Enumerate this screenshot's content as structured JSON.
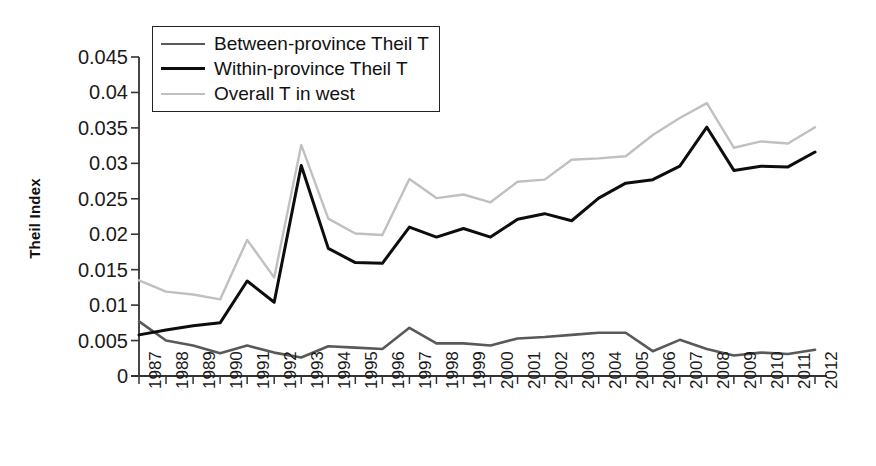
{
  "chart_data": {
    "type": "line",
    "title": "",
    "xlabel": "",
    "ylabel": "Theil Index",
    "ylim": [
      0,
      0.045
    ],
    "ytick_values": [
      0,
      0.005,
      0.01,
      0.015,
      0.02,
      0.025,
      0.03,
      0.035,
      0.04,
      0.045
    ],
    "ytick_labels": [
      "0",
      "0.005",
      "0.01",
      "0.015",
      "0.02",
      "0.025",
      "0.03",
      "0.035",
      "0.04",
      "0.045"
    ],
    "grid": false,
    "legend_position": "top-left-inside",
    "categories": [
      1987,
      1988,
      1989,
      1990,
      1991,
      1992,
      1993,
      1994,
      1995,
      1996,
      1997,
      1998,
      1999,
      2000,
      2001,
      2002,
      2003,
      2004,
      2005,
      2006,
      2007,
      2008,
      2009,
      2010,
      2011,
      2012
    ],
    "xtick_labels": [
      "1987",
      "1988",
      "1989",
      "1990",
      "1991",
      "1992",
      "1993",
      "1994",
      "1995",
      "1996",
      "1997",
      "1998",
      "1999",
      "2000",
      "2001",
      "2002",
      "2003",
      "2004",
      "2005",
      "2006",
      "2007",
      "2008",
      "2009",
      "2010",
      "2011",
      "2012"
    ],
    "series": [
      {
        "name": "Between-province Theil T",
        "color": "#595959",
        "width": 2.6,
        "values": [
          0.0077,
          0.005,
          0.0043,
          0.0032,
          0.0043,
          0.0033,
          0.0026,
          0.0042,
          0.004,
          0.0038,
          0.0068,
          0.0046,
          0.0046,
          0.0043,
          0.0053,
          0.0055,
          0.0058,
          0.0061,
          0.0061,
          0.0035,
          0.0051,
          0.0038,
          0.0029,
          0.0033,
          0.0031,
          0.0037
        ]
      },
      {
        "name": "Within-province Theil T",
        "color": "#0d0d0d",
        "width": 3.0,
        "values": [
          0.0058,
          0.0065,
          0.0071,
          0.0075,
          0.0134,
          0.0104,
          0.0297,
          0.018,
          0.016,
          0.0159,
          0.021,
          0.0196,
          0.0208,
          0.0196,
          0.0221,
          0.0229,
          0.0219,
          0.0251,
          0.0272,
          0.0277,
          0.0296,
          0.0351,
          0.029,
          0.0296,
          0.0295,
          0.0316
        ]
      },
      {
        "name": "Overall T in west",
        "color": "#c0c0c0",
        "width": 2.4,
        "values": [
          0.0135,
          0.0119,
          0.0115,
          0.0108,
          0.0192,
          0.0139,
          0.0326,
          0.0222,
          0.0201,
          0.0199,
          0.0278,
          0.0251,
          0.0256,
          0.0245,
          0.0274,
          0.0277,
          0.0305,
          0.0307,
          0.031,
          0.034,
          0.0364,
          0.0385,
          0.0322,
          0.0331,
          0.0328,
          0.0351
        ]
      }
    ]
  },
  "legend": {
    "items": [
      {
        "label": "Between-province Theil T"
      },
      {
        "label": "Within-province Theil T"
      },
      {
        "label": "Overall T in west"
      }
    ]
  },
  "axes": {
    "y_title": "Theil Index"
  }
}
